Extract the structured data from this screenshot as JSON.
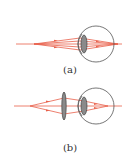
{
  "figure": {
    "panels": [
      {
        "id": "a",
        "caption": "(a)",
        "description": "eye focusing parallel rays beyond retina"
      },
      {
        "id": "b",
        "caption": "(b)",
        "description": "converging corrective lens in front of eye"
      }
    ],
    "colors": {
      "ray": "#e8604a",
      "eye_outline": "#555555",
      "lens_fill": "#8a8a8a",
      "lens_stroke": "#444444"
    }
  }
}
